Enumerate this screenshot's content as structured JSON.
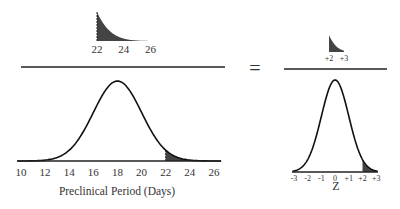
{
  "chart_data": {
    "type": "area",
    "title": "",
    "panels": [
      {
        "name": "numerator-tail",
        "description": "Shaded right tail of preclinical period distribution beyond 22 days",
        "x_ticks": [
          "22",
          "24",
          "26"
        ],
        "shade_from": 22,
        "shade_to": 26
      },
      {
        "name": "preclinical-distribution",
        "xlabel": "Preclinical Period (Days)",
        "x_ticks": [
          "10",
          "12",
          "14",
          "16",
          "18",
          "20",
          "22",
          "24",
          "26"
        ],
        "xlim": [
          10,
          26
        ],
        "mean": 18,
        "sd": 2,
        "shade_from": 22,
        "shade_to": 26
      },
      {
        "name": "z-numerator-tail",
        "x_ticks": [
          "+2",
          "+3"
        ],
        "shade_from": 2,
        "shade_to": 3
      },
      {
        "name": "standard-normal",
        "xlabel": "Z",
        "x_ticks": [
          "-3",
          "-2",
          "-1",
          "0",
          "+1",
          "+2",
          "+3"
        ],
        "xlim": [
          -3,
          3
        ],
        "mean": 0,
        "sd": 1,
        "shade_from": 2,
        "shade_to": 3
      }
    ]
  },
  "equals_sign": "=",
  "colors": {
    "shade": "#444444",
    "line": "#1a1a1a"
  }
}
